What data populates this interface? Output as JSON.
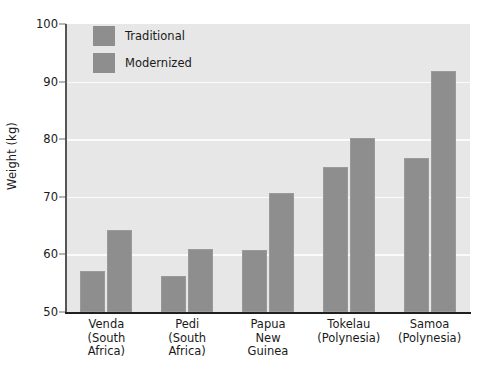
{
  "chart_data": {
    "type": "bar",
    "title": "",
    "xlabel": "",
    "ylabel": "Weight (kg)",
    "ylim": [
      50,
      100
    ],
    "ytick_step": 10,
    "yticks": [
      50,
      60,
      70,
      80,
      90,
      100
    ],
    "ytick_labels": [
      "50",
      "60",
      "70",
      "80",
      "90",
      "100"
    ],
    "grid": "horizontal",
    "legend_position": "top-left-inside",
    "categories": [
      "Venda\n(South\nAfrica)",
      "Pedi\n(South\nAfrica)",
      "Papua\nNew\nGuinea",
      "Tokelau\n(Polynesia)",
      "Samoa\n(Polynesia)"
    ],
    "category_lines": [
      [
        "Venda",
        "(South",
        "Africa)"
      ],
      [
        "Pedi",
        "(South",
        "Africa)"
      ],
      [
        "Papua",
        "New",
        "Guinea"
      ],
      [
        "Tokelau",
        "(Polynesia)"
      ],
      [
        "Samoa",
        "(Polynesia)"
      ]
    ],
    "series": [
      {
        "name": "Traditional",
        "values": [
          57.1,
          56.3,
          60.8,
          75.1,
          76.8
        ]
      },
      {
        "name": "Modernized",
        "values": [
          64.2,
          61.0,
          70.6,
          80.2,
          91.8
        ]
      }
    ],
    "colors": {
      "traditional": "#8e8e8e",
      "modernized": "#8e8e8e",
      "plot_background": "#e7e7e7",
      "gridline": "#fbfbfb",
      "axis": "#1f1f1f",
      "text": "#1a1a1a"
    }
  },
  "legend": {
    "entries": [
      {
        "label": "Traditional",
        "swatch_name": "legend-swatch-traditional"
      },
      {
        "label": "Modernized",
        "swatch_name": "legend-swatch-modernized"
      }
    ]
  }
}
